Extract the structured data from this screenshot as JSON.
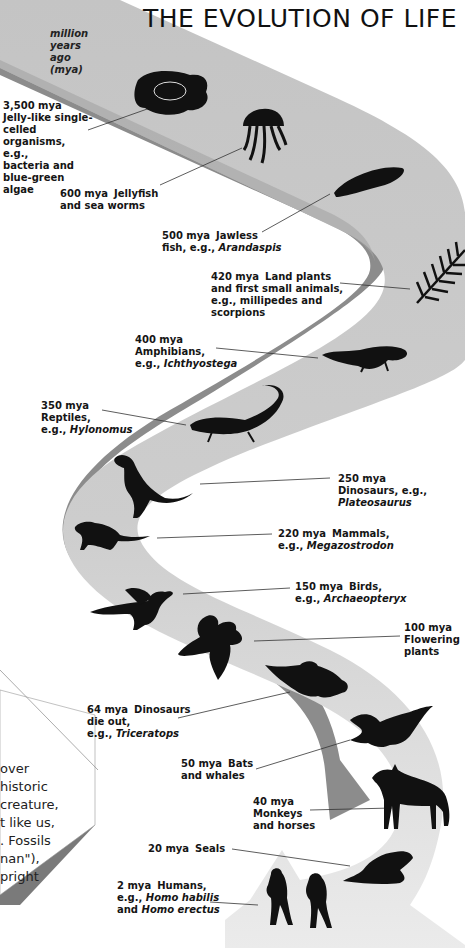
{
  "title": "THE EVOLUTION OF LIFE",
  "unit_label": [
    "million",
    "years",
    "ago",
    "(mya)"
  ],
  "colors": {
    "ribbon_top": "#c8c8c8",
    "ribbon_top_light": "#e4e4e4",
    "ribbon_side": "#8a8a8a",
    "silhouette": "#111111",
    "leader_line": "#333333",
    "text": "#151515"
  },
  "events": [
    {
      "mya": "3,500 mya",
      "lines": [
        "Jelly-like single-",
        "celled",
        "organisms, e.g.,",
        "bacteria and",
        "blue-green",
        "algae"
      ],
      "icon": "cell-icon"
    },
    {
      "mya": "600 mya",
      "lines": [
        "Jellyfish",
        "and sea worms"
      ],
      "icon": "jellyfish-icon"
    },
    {
      "mya": "500 mya",
      "lines": [
        "Jawless",
        "fish, e.g., "
      ],
      "example": "Arandaspis",
      "icon": "jawless-fish-icon"
    },
    {
      "mya": "420 mya",
      "lines": [
        "Land plants",
        "and first small animals,",
        "e.g., millipedes and",
        "scorpions"
      ],
      "icon": "fern-icon"
    },
    {
      "mya": "400 mya",
      "lines": [
        "Amphibians,",
        "e.g., "
      ],
      "example": "Ichthyostega",
      "icon": "amphibian-icon"
    },
    {
      "mya": "350 mya",
      "lines": [
        "Reptiles,",
        "e.g., "
      ],
      "example": "Hylonomus",
      "icon": "reptile-icon"
    },
    {
      "mya": "250 mya",
      "lines": [
        "Dinosaurs, e.g.,"
      ],
      "example": "Plateosaurus",
      "icon": "dinosaur-icon"
    },
    {
      "mya": "220 mya",
      "lines": [
        "Mammals,",
        "e.g., "
      ],
      "example": "Megazostrodon",
      "icon": "mammal-icon"
    },
    {
      "mya": "150 mya",
      "lines": [
        "Birds,",
        "e.g., "
      ],
      "example": "Archaeopteryx",
      "icon": "bird-icon"
    },
    {
      "mya": "100 mya",
      "lines": [
        "Flowering",
        "plants"
      ],
      "icon": "flower-icon"
    },
    {
      "mya": "64 mya",
      "lines": [
        "Dinosaurs",
        "die out,",
        "e.g., "
      ],
      "example": "Triceratops",
      "icon": "triceratops-icon"
    },
    {
      "mya": "50 mya",
      "lines": [
        "Bats",
        "and whales"
      ],
      "icon": "bat-icon"
    },
    {
      "mya": "40 mya",
      "lines": [
        "Monkeys",
        "and horses"
      ],
      "icon": "horse-icon"
    },
    {
      "mya": "20 mya",
      "lines": [
        "Seals"
      ],
      "icon": "seal-icon"
    },
    {
      "mya": "2 mya",
      "lines": [
        "Humans,",
        "e.g., ",
        "and "
      ],
      "example": "Homo habilis",
      "example2": "Homo erectus",
      "icon": "humans-icon"
    }
  ],
  "side_card": {
    "lines": [
      "over",
      "historic",
      " creature,",
      "t like us,",
      ". Fossils",
      "nan\"),",
      "pright"
    ]
  }
}
